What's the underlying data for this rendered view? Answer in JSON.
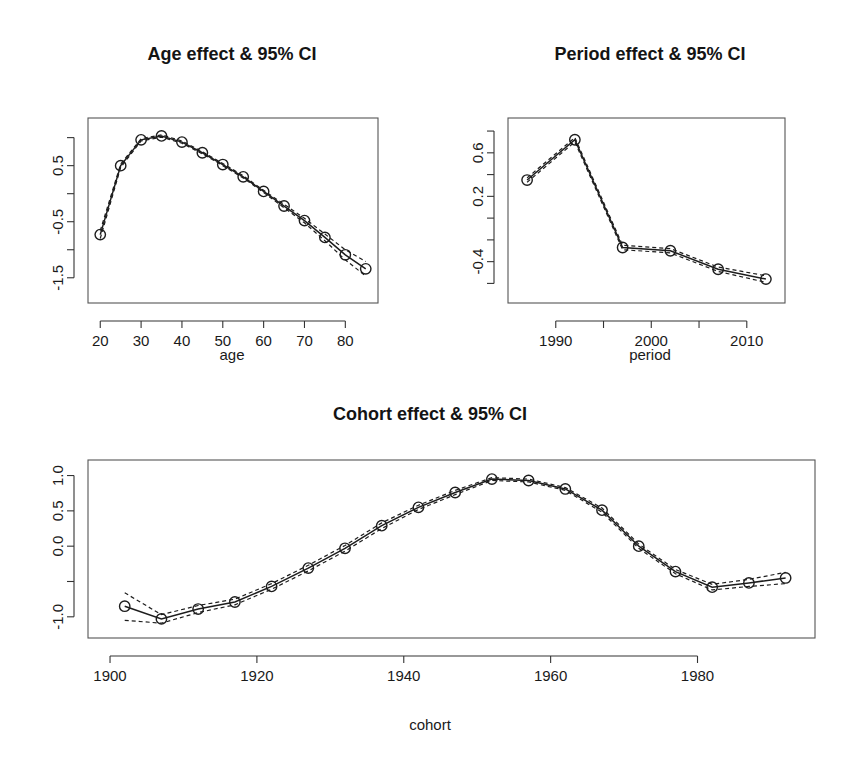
{
  "figure": {
    "background": "#ffffff",
    "line_color": "#1d1d1d",
    "axis_color": "#333333"
  },
  "chart_data": [
    {
      "type": "line",
      "id": "age",
      "title": "Age effect & 95% CI",
      "xlabel": "age",
      "ylabel": "",
      "grid": false,
      "legend": null,
      "xlim": [
        17,
        88
      ],
      "ylim": [
        -1.95,
        1.35
      ],
      "xticks": [
        20,
        30,
        40,
        50,
        60,
        70,
        80
      ],
      "xticklabels": [
        "20",
        "30",
        "40",
        "50",
        "60",
        "70",
        "80"
      ],
      "yticks": [
        1.0,
        0.5,
        0.0,
        -0.5,
        -1.0,
        -1.5
      ],
      "yticklabels": [
        "",
        "0.5",
        "",
        "-0.5",
        "",
        "-1.5"
      ],
      "x": [
        20,
        25,
        30,
        35,
        40,
        45,
        50,
        55,
        60,
        65,
        70,
        75,
        80,
        85
      ],
      "values": [
        -0.73,
        0.5,
        0.96,
        1.03,
        0.92,
        0.73,
        0.52,
        0.3,
        0.04,
        -0.22,
        -0.48,
        -0.78,
        -1.09,
        -1.34
      ],
      "ci_lower": [
        -0.8,
        0.47,
        0.94,
        1.01,
        0.9,
        0.71,
        0.5,
        0.28,
        0.02,
        -0.25,
        -0.52,
        -0.84,
        -1.18,
        -1.47
      ],
      "ci_upper": [
        -0.66,
        0.53,
        0.98,
        1.05,
        0.94,
        0.75,
        0.54,
        0.32,
        0.06,
        -0.19,
        -0.44,
        -0.72,
        -1.0,
        -1.21
      ]
    },
    {
      "type": "line",
      "id": "period",
      "title": "Period effect & 95% CI",
      "xlabel": "period",
      "ylabel": "",
      "grid": false,
      "legend": null,
      "xlim": [
        1985.0,
        2014.0
      ],
      "ylim": [
        -0.78,
        0.92
      ],
      "xticks": [
        1990,
        1995,
        2000,
        2005,
        2010
      ],
      "xticklabels": [
        "1990",
        "",
        "2000",
        "",
        "2010"
      ],
      "yticks": [
        0.8,
        0.6,
        0.4,
        0.2,
        0.0,
        -0.2,
        -0.4,
        -0.6
      ],
      "yticklabels": [
        "",
        "0.6",
        "",
        "0.2",
        "",
        "",
        "-0.4",
        ""
      ],
      "x": [
        1987,
        1992,
        1997,
        2002,
        2007,
        2012
      ],
      "values": [
        0.35,
        0.72,
        -0.27,
        -0.3,
        -0.47,
        -0.56
      ],
      "ci_lower": [
        0.33,
        0.7,
        -0.29,
        -0.32,
        -0.49,
        -0.59
      ],
      "ci_upper": [
        0.37,
        0.74,
        -0.25,
        -0.28,
        -0.45,
        -0.53
      ]
    },
    {
      "type": "line",
      "id": "cohort",
      "title": "Cohort effect & 95% CI",
      "xlabel": "cohort",
      "ylabel": "",
      "grid": false,
      "legend": null,
      "xlim": [
        1897,
        1996
      ],
      "ylim": [
        -1.3,
        1.22
      ],
      "xticks": [
        1900,
        1920,
        1940,
        1960,
        1980
      ],
      "xticklabels": [
        "1900",
        "1920",
        "1940",
        "1960",
        "1980"
      ],
      "yticks": [
        1.0,
        0.5,
        0.0,
        -0.5,
        -1.0
      ],
      "yticklabels": [
        "1.0",
        "0.5",
        "0.0",
        "",
        "-1.0"
      ],
      "x": [
        1902,
        1907,
        1912,
        1917,
        1922,
        1927,
        1932,
        1937,
        1942,
        1947,
        1952,
        1957,
        1962,
        1967,
        1972,
        1977,
        1982,
        1987,
        1992
      ],
      "values": [
        -0.85,
        -1.03,
        -0.89,
        -0.79,
        -0.57,
        -0.31,
        -0.03,
        0.29,
        0.55,
        0.76,
        0.95,
        0.93,
        0.81,
        0.51,
        0.0,
        -0.36,
        -0.58,
        -0.52,
        -0.45
      ],
      "ci_lower": [
        -1.05,
        -1.09,
        -0.94,
        -0.83,
        -0.61,
        -0.35,
        -0.07,
        0.25,
        0.52,
        0.73,
        0.93,
        0.91,
        0.79,
        0.48,
        -0.03,
        -0.39,
        -0.62,
        -0.57,
        -0.53
      ],
      "ci_upper": [
        -0.66,
        -0.97,
        -0.84,
        -0.75,
        -0.53,
        -0.27,
        0.01,
        0.33,
        0.58,
        0.79,
        0.97,
        0.95,
        0.83,
        0.54,
        0.03,
        -0.33,
        -0.54,
        -0.47,
        -0.37
      ]
    }
  ]
}
